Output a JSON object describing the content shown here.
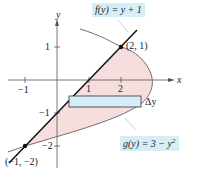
{
  "figure": {
    "type": "region between curves",
    "functions": [
      {
        "name": "f",
        "label": "f(y) = y + 1",
        "expr": "x = y + 1"
      },
      {
        "name": "g",
        "label": "g(y) = 3 − y",
        "sup": "2",
        "expr": "x = 3 - y^2"
      }
    ],
    "axes": {
      "x_label": "x",
      "y_label": "y",
      "x_ticks": [
        "−1",
        "1",
        "2"
      ],
      "y_ticks": [
        "1",
        "−1",
        "−2"
      ]
    },
    "points": [
      {
        "label": "(2, 1)",
        "x": 2,
        "y": 1
      },
      {
        "label": "(−1, −2)",
        "x": -1,
        "y": -2
      }
    ],
    "rectangle_label": "Δy",
    "colors": {
      "region_fill": "#f6dede",
      "rectangle_fill": "#d6eef7",
      "label_box": "#d6eef7",
      "curve": "#7a6a6a",
      "line": "#111111"
    }
  }
}
